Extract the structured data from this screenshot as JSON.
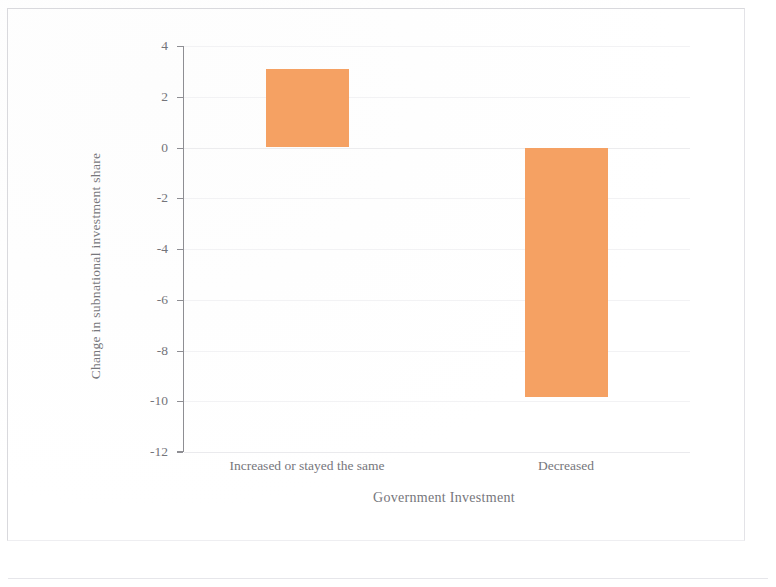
{
  "chart_data": {
    "type": "bar",
    "title": "",
    "xlabel": "Government Investment",
    "ylabel": "Change in subnational investment share",
    "categories": [
      "Increased or stayed the same",
      "Decreased"
    ],
    "values": [
      3.1,
      -9.85
    ],
    "ylim": [
      -12,
      4
    ],
    "yticks": [
      4,
      2,
      0,
      -2,
      -4,
      -6,
      -8,
      -10,
      -12
    ],
    "ytick_labels": [
      "4",
      "2",
      "0",
      "-2",
      "-4",
      "-6",
      "-8",
      "-10",
      "-12"
    ],
    "series": [
      {
        "name": "Change in subnational investment share",
        "values": [
          3.1,
          -9.85
        ],
        "color": "#F5A163"
      }
    ],
    "grid": true,
    "legend": "none",
    "bar_color": "#F5A163",
    "axis_color": "#8E8E93",
    "zero_line": 0
  }
}
